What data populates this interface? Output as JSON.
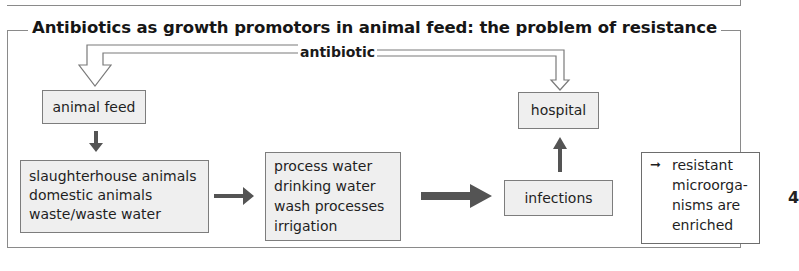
{
  "figure": {
    "title": "Antibiotics as growth promotors in animal feed: the problem of resistance",
    "source_label": "antibiotic",
    "nodes": {
      "animal_feed": "animal feed",
      "animals": [
        "slaughterhouse animals",
        "domestic animals",
        "waste/waste water"
      ],
      "water": [
        "process water",
        "drinking water",
        "wash processes",
        "irrigation"
      ],
      "infections": "infections",
      "hospital": "hospital"
    },
    "legend": {
      "lines": [
        "resistant",
        "microorga-",
        "nisms are",
        "enriched"
      ]
    },
    "page_marker": "4",
    "colors": {
      "box_fill": "#efefef",
      "box_border": "#7d7d7d",
      "arrow_fill": "#545454",
      "frame_line": "#8a8a8a"
    }
  }
}
